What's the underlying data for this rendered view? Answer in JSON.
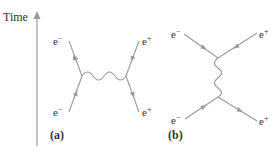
{
  "axis": {
    "label": "Time",
    "color": "#9a9a9a"
  },
  "colors": {
    "line": "#9a9a9a",
    "text": "#333333"
  },
  "diagram_a": {
    "panel_label": "(a)",
    "labels": {
      "top_left": "e−",
      "bottom_left": "e−",
      "top_right": "e+",
      "bottom_right": "e+"
    }
  },
  "diagram_b": {
    "panel_label": "(b)",
    "labels": {
      "top_left": "e−",
      "bottom_left": "e−",
      "top_right": "e+",
      "bottom_right": "e+"
    }
  }
}
